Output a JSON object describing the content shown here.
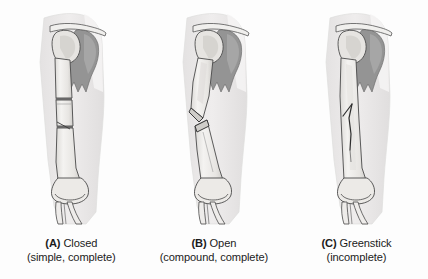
{
  "figure": {
    "type": "medical-illustration",
    "background_color": "#fdfdfd",
    "panel_count": 3
  },
  "palette": {
    "skin_fill": "#eceaea",
    "skin_edge": "#dedcdc",
    "bone_fill": "#f2f1ef",
    "bone_shade": "#d9d7d4",
    "bone_outline": "#4a4a4a",
    "scapula_dark": "#8d8d8d",
    "scapula_mid": "#a8a8a8",
    "fracture_line": "#3a3a3a",
    "caption_text": "#1b1b1b"
  },
  "panels": [
    {
      "id": "panel-a",
      "tag": "(A)",
      "name": "Closed",
      "caption_line1": "Closed",
      "caption_line2": "(simple, complete)",
      "fracture_type": "transverse-complete",
      "skin_intact": true,
      "anatomy": [
        "clavicle",
        "scapula",
        "humeral head",
        "humerus shaft",
        "humeral condyles",
        "radius",
        "ulna"
      ]
    },
    {
      "id": "panel-b",
      "tag": "(B)",
      "name": "Open",
      "caption_line1": "Open",
      "caption_line2": "(compound, complete)",
      "fracture_type": "displaced-angulated-complete",
      "skin_intact": false,
      "anatomy": [
        "clavicle",
        "scapula",
        "humeral head",
        "humerus shaft",
        "humeral condyles",
        "radius",
        "ulna"
      ]
    },
    {
      "id": "panel-c",
      "tag": "(C)",
      "name": "Greenstick",
      "caption_line1": "Greenstick",
      "caption_line2": "(incomplete)",
      "fracture_type": "longitudinal-incomplete",
      "skin_intact": true,
      "anatomy": [
        "clavicle",
        "scapula",
        "humeral head",
        "humerus shaft",
        "humeral condyles",
        "radius",
        "ulna"
      ]
    }
  ]
}
